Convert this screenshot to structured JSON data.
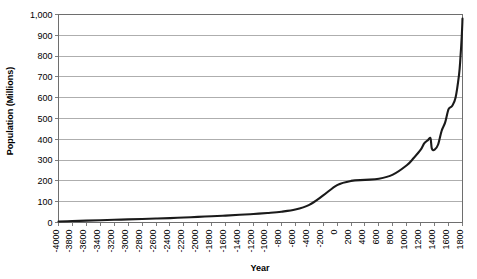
{
  "chart_data": {
    "type": "line",
    "title": "",
    "xlabel": "Year",
    "ylabel": "Population (Millions)",
    "xlim": [
      -4000,
      1800
    ],
    "ylim": [
      0,
      1000
    ],
    "grid": true,
    "legend": false,
    "legend_position": "none",
    "line_color": "#1a1a1a",
    "grid_color": "#9a9a9a",
    "axis_color": "#6e6e6e",
    "y_ticks": [
      0,
      100,
      200,
      300,
      400,
      500,
      600,
      700,
      800,
      900,
      1000
    ],
    "y_tick_labels": [
      "0",
      "100",
      "200",
      "300",
      "400",
      "500",
      "600",
      "700",
      "800",
      "900",
      "1,000"
    ],
    "x_ticks": [
      -4000,
      -3800,
      -3600,
      -3400,
      -3200,
      -3000,
      -2800,
      -2600,
      -2400,
      -2200,
      -2000,
      -1800,
      -1600,
      -1400,
      -1200,
      -1000,
      -800,
      -600,
      -400,
      -200,
      0,
      200,
      400,
      600,
      800,
      1000,
      1200,
      1400,
      1600,
      1800
    ],
    "x_tick_labels": [
      "-4000",
      "-3800",
      "-3600",
      "-3400",
      "-3200",
      "-3000",
      "-2800",
      "-2600",
      "-2400",
      "-2200",
      "-2000",
      "-1800",
      "-1600",
      "-1400",
      "-1200",
      "-1000",
      "-800",
      "-600",
      "-400",
      "-200",
      "0",
      "200",
      "400",
      "600",
      "800",
      "1000",
      "1200",
      "1400",
      "1600",
      "1800"
    ],
    "series": [
      {
        "name": "World Population",
        "x": [
          -4000,
          -3800,
          -3600,
          -3400,
          -3200,
          -3000,
          -2800,
          -2600,
          -2400,
          -2200,
          -2000,
          -1800,
          -1600,
          -1400,
          -1200,
          -1000,
          -800,
          -600,
          -400,
          -200,
          0,
          200,
          400,
          600,
          800,
          1000,
          1100,
          1200,
          1250,
          1300,
          1340,
          1360,
          1400,
          1450,
          1500,
          1550,
          1600,
          1650,
          1700,
          1750,
          1770,
          1790,
          1800
        ],
        "y": [
          5,
          7,
          9,
          11,
          13,
          15,
          17,
          19,
          21,
          24,
          27,
          30,
          33,
          37,
          41,
          46,
          52,
          62,
          85,
          130,
          180,
          200,
          205,
          210,
          230,
          275,
          310,
          350,
          380,
          395,
          405,
          355,
          350,
          375,
          440,
          480,
          545,
          560,
          600,
          710,
          790,
          900,
          980
        ],
        "color": "#1a1a1a",
        "linewidth": 2.1
      }
    ],
    "annotations": []
  }
}
